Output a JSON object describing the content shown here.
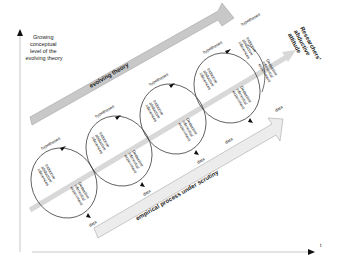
{
  "axes": {
    "y_label": [
      "Growing",
      "conceptual",
      "level of the",
      "evolving theory"
    ],
    "x_label": "t"
  },
  "bands": {
    "top": "evolving theory",
    "bottom": "empirical process under scrutiny",
    "diagonal_label": [
      "Researchers'",
      "abductive",
      "attitude"
    ]
  },
  "loops": [
    {
      "hypothesis": "hypotheses",
      "inductive": [
        "Inductive",
        "abductive",
        "inferences"
      ],
      "deductive": [
        "Deductive",
        "inferential",
        "experiment"
      ],
      "data": "data"
    },
    {
      "hypothesis": "hypotheses",
      "inductive": [
        "Inductive",
        "abductive",
        "inferences"
      ],
      "deductive": [
        "Deductive",
        "inferential",
        "experiment"
      ],
      "data": "data"
    },
    {
      "hypothesis": "hypotheses",
      "inductive": [
        "Inductive",
        "abductive",
        "inferences"
      ],
      "deductive": [
        "Deductive",
        "inferential",
        "experiment"
      ],
      "data": "data"
    },
    {
      "hypothesis": "hypotheses",
      "inductive": [
        "Inductive",
        "abductive",
        "inferences"
      ],
      "deductive": [
        "Deductive",
        "inferential",
        "experiment"
      ],
      "data": "data"
    },
    {
      "hypothesis": "hypotheses",
      "inductive": [
        "Inductive",
        "abductive",
        "inferences"
      ],
      "deductive": [
        "Deductive",
        "inferential",
        "experiment"
      ],
      "data": "data"
    }
  ],
  "colors": {
    "band_fill": "#c8c8c8",
    "band_light": "#e8e8e8",
    "diagonal": "#d8d8d8",
    "line": "#333333"
  }
}
